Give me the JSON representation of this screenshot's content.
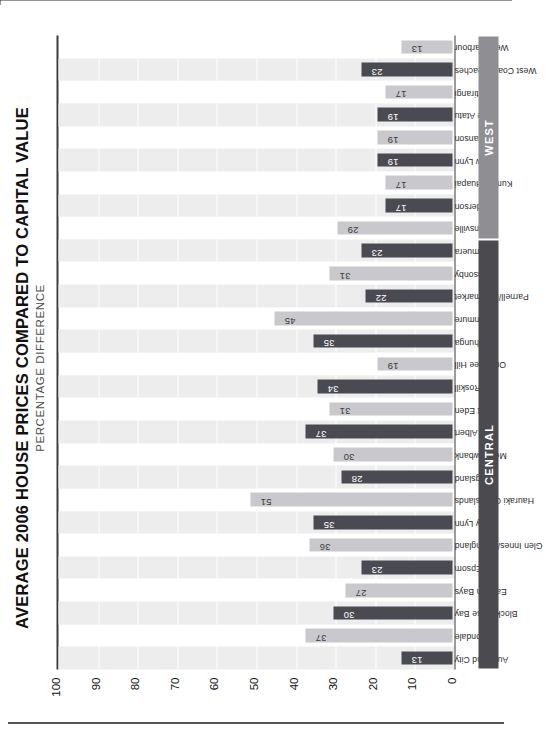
{
  "chart_data": {
    "type": "bar",
    "title": "AVERAGE 2006 HOUSE PRICES COMPARED TO CAPITAL VALUE",
    "subtitle": "PERCENTAGE DIFFERENCE",
    "xlabel": "",
    "ylabel": "",
    "ylim": [
      0,
      100
    ],
    "yticks": [
      "0",
      "10",
      "20",
      "30",
      "40",
      "50",
      "60",
      "70",
      "80",
      "90",
      "100"
    ],
    "grid": true,
    "legend": "none",
    "orientation": "vertical-bars-on-rotated-page",
    "categories": [
      "Auckland City",
      "Avondale",
      "Blockhouse Bay",
      "Eastern Bays",
      "Epsom",
      "Glen Innes/Pt England",
      "Grey Lynn",
      "Hauraki Gulf Islands",
      "Kingsland",
      "Meadowbank",
      "Mt Albert",
      "Mt Eden",
      "Mt Roskill",
      "One Tree Hill",
      "Onehunga",
      "Panmure",
      "Parnell/Newmarket",
      "Ponsonby",
      "Remuera",
      "Helensville",
      "Henderson",
      "Kumeu/Huapai",
      "New Lynn",
      "Swanson",
      "Te Atatu",
      "Titirangi",
      "West Coast Beaches",
      "West Harbour"
    ],
    "values": [
      13,
      37,
      30,
      27,
      23,
      36,
      35,
      51,
      28,
      30,
      37,
      31,
      34,
      19,
      35,
      45,
      22,
      31,
      23,
      29,
      17,
      17,
      19,
      19,
      19,
      17,
      23,
      13
    ],
    "groups": [
      {
        "label": "CENTRAL",
        "start_index": 0,
        "end_index": 18,
        "color": "#4a4a4f"
      },
      {
        "label": "WEST",
        "start_index": 19,
        "end_index": 27,
        "color": "#8e8e93"
      }
    ],
    "bar_colors": {
      "dark": "#4a4a52",
      "light": "#c9c9cd"
    },
    "bar_color_pattern": [
      "dark",
      "light",
      "dark",
      "light",
      "dark",
      "light",
      "dark",
      "light",
      "dark",
      "light",
      "dark",
      "light",
      "dark",
      "light",
      "dark",
      "light",
      "dark",
      "light",
      "dark",
      "light",
      "dark",
      "light",
      "dark",
      "light",
      "dark",
      "light",
      "dark",
      "light"
    ],
    "band_color": "#ededed"
  }
}
